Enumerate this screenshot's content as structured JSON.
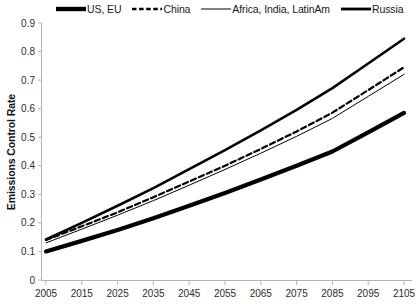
{
  "chart_data": {
    "type": "line",
    "title": "",
    "xlabel": "",
    "ylabel": "Emissions Control Rate",
    "x": [
      2005,
      2015,
      2025,
      2035,
      2045,
      2055,
      2065,
      2075,
      2085,
      2095,
      2105
    ],
    "xlim": [
      2005,
      2105
    ],
    "ylim": [
      0,
      0.9
    ],
    "ytick_labels": [
      "0",
      "0.1",
      "0.2",
      "0.3",
      "0.4",
      "0.5",
      "0.6",
      "0.7",
      "0.8",
      "0.9"
    ],
    "ytick_values": [
      0,
      0.1,
      0.2,
      0.3,
      0.4,
      0.5,
      0.6,
      0.7,
      0.8,
      0.9
    ],
    "xtick_labels": [
      "2005",
      "2015",
      "2025",
      "2035",
      "2045",
      "2055",
      "2065",
      "2075",
      "2085",
      "2095",
      "2105"
    ],
    "grid": false,
    "legend_position": "top",
    "series": [
      {
        "name": "US, EU",
        "style": "solid",
        "width": 4.2,
        "color": "#000000",
        "values": [
          0.1,
          0.137,
          0.175,
          0.216,
          0.26,
          0.305,
          0.352,
          0.4,
          0.45,
          0.517,
          0.585
        ]
      },
      {
        "name": "China",
        "style": "dashed",
        "width": 2.2,
        "color": "#000000",
        "values": [
          0.14,
          0.188,
          0.237,
          0.29,
          0.345,
          0.4,
          0.459,
          0.52,
          0.586,
          0.665,
          0.745
        ]
      },
      {
        "name": "Africa, India, LatinAm",
        "style": "solid",
        "width": 1.0,
        "color": "#000000",
        "values": [
          0.13,
          0.178,
          0.227,
          0.278,
          0.332,
          0.387,
          0.444,
          0.503,
          0.566,
          0.643,
          0.72
        ]
      },
      {
        "name": "Russia",
        "style": "solid",
        "width": 2.6,
        "color": "#000000",
        "values": [
          0.142,
          0.2,
          0.26,
          0.322,
          0.388,
          0.455,
          0.524,
          0.596,
          0.672,
          0.758,
          0.845
        ]
      }
    ]
  },
  "legend": {
    "items": [
      {
        "label": "US, EU",
        "style": "solid",
        "width": 4.2
      },
      {
        "label": "China",
        "style": "dashed",
        "width": 2.2
      },
      {
        "label": "Africa, India, LatinAm",
        "style": "solid",
        "width": 1.0
      },
      {
        "label": "Russia",
        "style": "solid",
        "width": 2.6
      }
    ]
  },
  "axis": {
    "y_title": "Emissions Control Rate"
  },
  "colors": {
    "line": "#000000",
    "axis": "#b3b3b3",
    "text": "#222222",
    "background": "#ffffff"
  }
}
